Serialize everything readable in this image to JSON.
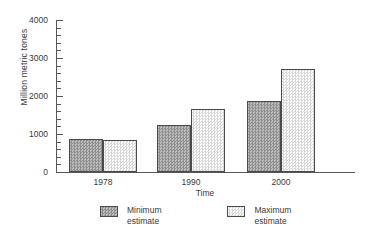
{
  "chart_data": {
    "type": "bar",
    "title": "",
    "xlabel": "Time",
    "ylabel": "Million metric tones",
    "categories": [
      "1978",
      "1990",
      "2000"
    ],
    "series": [
      {
        "name": "Minimum estimate",
        "values": [
          870,
          1250,
          1880
        ],
        "swatch": "min"
      },
      {
        "name": "Maximum estimate",
        "values": [
          840,
          1660,
          2700
        ],
        "swatch": "max"
      }
    ],
    "ylim": [
      0,
      4000
    ],
    "ytick_labels": [
      "0",
      "1000",
      "2000",
      "3000",
      "4000"
    ],
    "ytick_values": [
      0,
      1000,
      2000,
      3000,
      4000
    ],
    "yminor_step": 200,
    "grid": false,
    "legend_position": "bottom"
  },
  "legend": {
    "entries": [
      {
        "label": "Minimum\nestimate",
        "swatch": "min"
      },
      {
        "label": "Maximum\nestimate",
        "swatch": "max"
      }
    ]
  },
  "colors": {
    "axis": "#575757",
    "bar_min_fill": "#a8a8a8",
    "bar_max_fill": "#fbfbfb",
    "bar_outline": "#4a4a4a",
    "text": "#3a3a3a",
    "background": "#ffffff"
  }
}
